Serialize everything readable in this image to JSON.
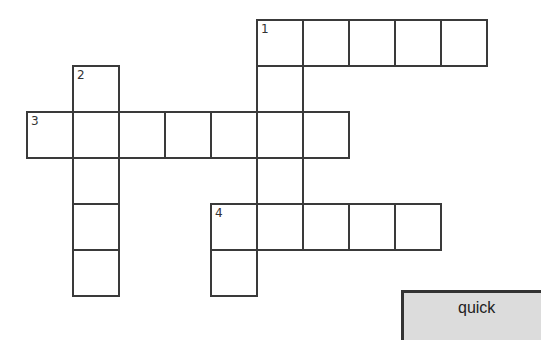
{
  "puzzle": {
    "cell_size": 46,
    "origin_x": 27,
    "origin_y": 20,
    "cells": [
      {
        "r": 0,
        "c": 5,
        "n": "1"
      },
      {
        "r": 0,
        "c": 6
      },
      {
        "r": 0,
        "c": 7
      },
      {
        "r": 0,
        "c": 8
      },
      {
        "r": 0,
        "c": 9
      },
      {
        "r": 1,
        "c": 1,
        "n": "2"
      },
      {
        "r": 1,
        "c": 5
      },
      {
        "r": 2,
        "c": 0,
        "n": "3"
      },
      {
        "r": 2,
        "c": 1
      },
      {
        "r": 2,
        "c": 2
      },
      {
        "r": 2,
        "c": 3
      },
      {
        "r": 2,
        "c": 4
      },
      {
        "r": 2,
        "c": 5
      },
      {
        "r": 2,
        "c": 6
      },
      {
        "r": 3,
        "c": 1
      },
      {
        "r": 3,
        "c": 5
      },
      {
        "r": 4,
        "c": 1
      },
      {
        "r": 4,
        "c": 4,
        "n": "4"
      },
      {
        "r": 4,
        "c": 5
      },
      {
        "r": 4,
        "c": 6
      },
      {
        "r": 4,
        "c": 7
      },
      {
        "r": 4,
        "c": 8
      },
      {
        "r": 5,
        "c": 1
      },
      {
        "r": 5,
        "c": 4
      }
    ],
    "entries": {
      "across": [
        {
          "number": "1",
          "length": 5
        },
        {
          "number": "3",
          "length": 7
        },
        {
          "number": "4",
          "length": 5
        }
      ],
      "down": [
        {
          "number": "1",
          "length": 5
        },
        {
          "number": "2",
          "length": 5
        },
        {
          "number": "4",
          "length": 2
        }
      ]
    }
  },
  "button": {
    "label": "quick"
  }
}
